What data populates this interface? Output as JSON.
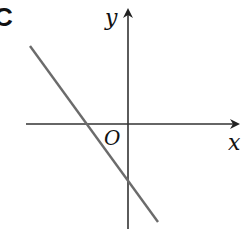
{
  "option_label": "C",
  "axes": {
    "x_label": "x",
    "y_label": "y",
    "origin_label": "O",
    "axis_color": "#333333"
  },
  "line": {
    "color": "#6b6b6b",
    "description": "Straight line with negative slope, negative x-intercept and negative y-intercept",
    "slope_sign": "negative",
    "x_intercept_sign": "negative",
    "y_intercept_sign": "negative"
  }
}
